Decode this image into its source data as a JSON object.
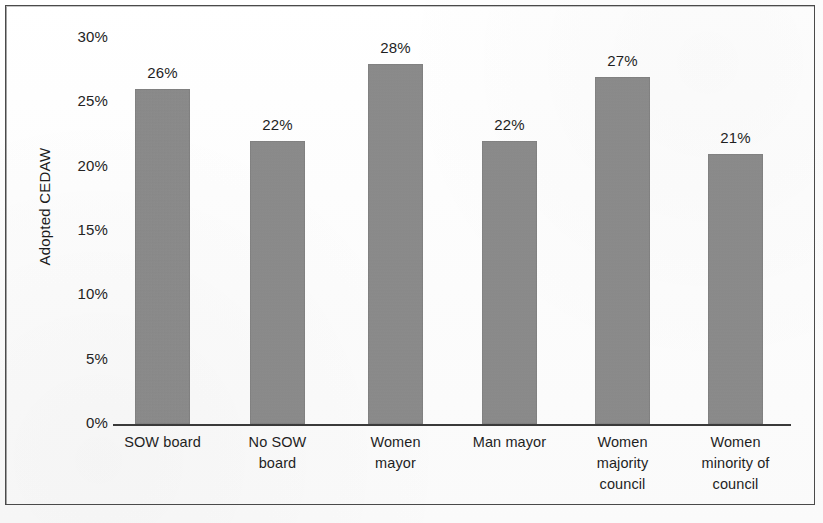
{
  "chart_data": {
    "type": "bar",
    "title": "",
    "subtitle": "",
    "xlabel": "",
    "ylabel": "Adopted CEDAW",
    "categories": [
      "SOW board",
      "No SOW board",
      "Women mayor",
      "Man mayor",
      "Women majority council",
      "Women minority of council"
    ],
    "category_lines": [
      [
        "SOW board"
      ],
      [
        "No SOW",
        "board"
      ],
      [
        "Women",
        "mayor"
      ],
      [
        "Man mayor"
      ],
      [
        "Women",
        "majority",
        "council"
      ],
      [
        "Women",
        "minority of",
        "council"
      ]
    ],
    "values": [
      26,
      22,
      28,
      22,
      27,
      21
    ],
    "value_labels": [
      "26%",
      "22%",
      "28%",
      "22%",
      "27%",
      "21%"
    ],
    "ylim": [
      0,
      30
    ],
    "ytick_values": [
      0,
      5,
      10,
      15,
      20,
      25,
      30
    ],
    "ytick_labels": [
      "0%",
      "5%",
      "10%",
      "15%",
      "20%",
      "25%",
      "30%"
    ],
    "grid": false,
    "legend": null,
    "bar_color": "#8a8a8a",
    "axis_color": "#3a3a3a",
    "text_color": "#1f1f1f",
    "frame_color": "#4a4a4a",
    "background_color": "#ffffff"
  }
}
